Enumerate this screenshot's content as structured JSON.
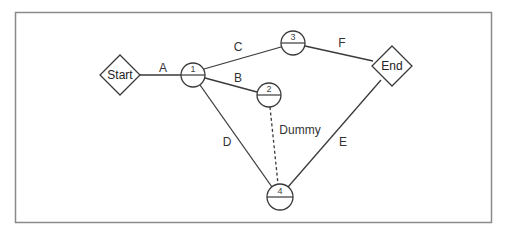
{
  "diagram": {
    "type": "activity-on-arrow network",
    "terminals": {
      "start": {
        "label": "Start",
        "cx": 120,
        "cy": 75
      },
      "end": {
        "label": "End",
        "cx": 392,
        "cy": 66
      }
    },
    "nodes": [
      {
        "id": "1",
        "label": "1",
        "cx": 193,
        "cy": 75
      },
      {
        "id": "2",
        "label": "2",
        "cx": 269,
        "cy": 95
      },
      {
        "id": "3",
        "label": "3",
        "cx": 293,
        "cy": 43
      },
      {
        "id": "4",
        "label": "4",
        "cx": 280,
        "cy": 197
      }
    ],
    "activities": [
      {
        "label": "A",
        "from": "Start",
        "to": "1"
      },
      {
        "label": "B",
        "from": "1",
        "to": "2"
      },
      {
        "label": "C",
        "from": "1",
        "to": "3"
      },
      {
        "label": "D",
        "from": "1",
        "to": "4"
      },
      {
        "label": "E",
        "from": "4",
        "to": "End"
      },
      {
        "label": "F",
        "from": "3",
        "to": "End"
      },
      {
        "label": "Dummy",
        "from": "2",
        "to": "4",
        "dashed": true
      }
    ],
    "colors": {
      "line": "#3a3a3a",
      "frame": "#8a8a8a",
      "background": "#ffffff"
    }
  }
}
